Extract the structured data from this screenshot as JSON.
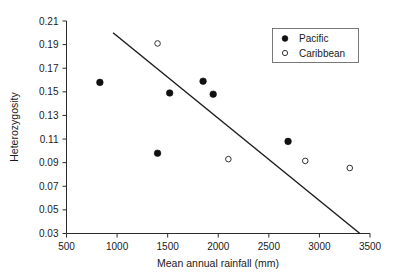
{
  "chart_data": {
    "type": "scatter",
    "title": "",
    "xlabel": "Mean annual rainfall (mm)",
    "ylabel": "Heterozygosity",
    "xlim": [
      500,
      3500
    ],
    "ylim": [
      0.03,
      0.21
    ],
    "xticks": [
      500,
      1000,
      1500,
      2000,
      2500,
      3000,
      3500
    ],
    "xtick_labels": [
      "500",
      "1000",
      "1500",
      "2000",
      "2500",
      "3000",
      "3500"
    ],
    "yticks": [
      0.03,
      0.05,
      0.07,
      0.09,
      0.11,
      0.13,
      0.15,
      0.17,
      0.19,
      0.21
    ],
    "ytick_labels": [
      "0.03",
      "0.05",
      "0.07",
      "0.09",
      "0.11",
      "0.13",
      "0.15",
      "0.17",
      "0.19",
      "0.21"
    ],
    "grid": false,
    "legend_position": "top-right",
    "series": [
      {
        "name": "Pacific",
        "marker": "filled-circle",
        "color": "#111111",
        "points": [
          {
            "x": 830,
            "y": 0.158
          },
          {
            "x": 1400,
            "y": 0.098
          },
          {
            "x": 1520,
            "y": 0.149
          },
          {
            "x": 1850,
            "y": 0.159
          },
          {
            "x": 1950,
            "y": 0.148
          },
          {
            "x": 2690,
            "y": 0.108
          }
        ]
      },
      {
        "name": "Caribbean",
        "marker": "open-circle",
        "color": "#333333",
        "points": [
          {
            "x": 1400,
            "y": 0.191
          },
          {
            "x": 2100,
            "y": 0.093
          },
          {
            "x": 2860,
            "y": 0.0915
          },
          {
            "x": 3300,
            "y": 0.0855
          }
        ]
      }
    ],
    "trend_line": {
      "name": "regression-line",
      "x1": 960,
      "y1": 0.2,
      "x2": 3400,
      "y2": 0.03
    }
  },
  "legend": {
    "entries": [
      {
        "label": "Pacific",
        "marker": "filled-circle"
      },
      {
        "label": "Caribbean",
        "marker": "open-circle"
      }
    ]
  },
  "axes": {
    "x_title": "Mean annual rainfall (mm)",
    "y_title": "Heterozygosity"
  }
}
